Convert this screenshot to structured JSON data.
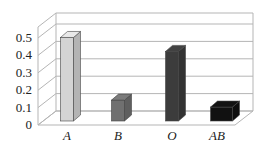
{
  "chart_data": {
    "type": "bar",
    "title": "",
    "xlabel": "",
    "ylabel": "",
    "categories": [
      "A",
      "B",
      "O",
      "AB"
    ],
    "values": [
      0.48,
      0.12,
      0.4,
      0.08
    ],
    "ylim": [
      0,
      0.5
    ],
    "yticks": [
      "0",
      "0.1",
      "0.2",
      "0.3",
      "0.4",
      "0.5"
    ],
    "grid": true,
    "style": "3d-column",
    "bar_colors": [
      "#d4d4d4",
      "#707070",
      "#3c3c3c",
      "#111111"
    ],
    "legend": null
  }
}
